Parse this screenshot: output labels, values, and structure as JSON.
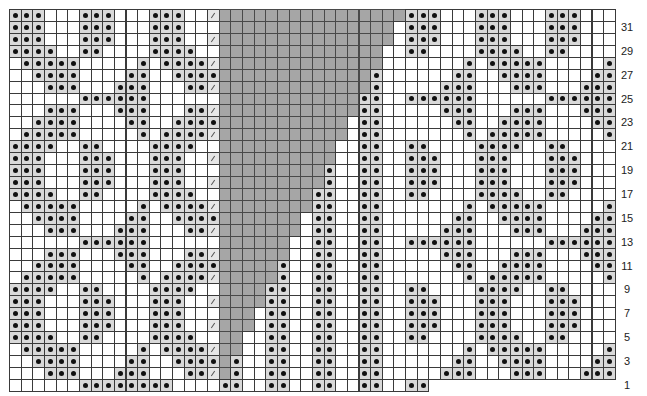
{
  "chart": {
    "title": "",
    "type": "knitting-chart",
    "origin": {
      "x": 9,
      "y": 9
    },
    "cell": {
      "w": 11.65,
      "h": 11.93
    },
    "legend_codes": {
      ".": "empty-cell",
      "o": "dot-stitch",
      "/": "slash-stitch",
      "#": "no-stitch",
      "_": "outside-grid"
    },
    "colors": {
      "dot_bg": "#d9d9d9",
      "no_stitch": "#a6a6a6",
      "grid_line": "#3a3a3a",
      "dot": "#111111"
    },
    "rows": [
      "ooo...ooo...ooo../################ooo...ooo...ooo...",
      "ooo...ooo...ooo...###############.ooo...ooo...ooo...",
      "ooo...ooo...ooo../###############.ooo...ooo...ooo...",
      "oooo..oo....oooo..##############..oo....oooo..oo....",
      ".ooooo.....o.oooo/##############.......o.ooooo.....o",
      "..oooo....oo..oooo#############o......oo..oooo....oo",
      "...ooo...ooo...oo/#############o.....ooo...ooo...ooo",
      "......oooooo......############oo..oooooo......oooooo",
      "...ooo...ooo...oo/############oo.....ooo...ooo...ooo",
      "..oooo....oo..oooo###########.oo......oo..oooo....oo",
      ".ooooo.....o.oooo/###########.oo.......o.ooooo.....o",
      "oooo..oo....oooo..##########..oo..oo....oooo..oo....",
      "ooo...ooo...ooo../##########..oo..ooo...ooo...ooo...",
      "ooo...ooo...ooo...#########o..oo..ooo...ooo...ooo...",
      "ooo...ooo...ooo../#########o..oo..ooo...ooo...ooo...",
      "oooo..oo....oooo..########oo..oo..oo....oooo..oo....",
      ".ooooo.....o.oooo/########oo..oo.......o.ooooo.....o",
      "..oooo....oo..oooo#######.oo..oo......oo..oooo....oo",
      "...ooo...ooo...oo/#######.oo..oo.....ooo...ooo...ooo",
      "......oooooo......######..oo..oo..oooooo......oooooo",
      "...ooo...ooo...oo/######..oo..oo.....ooo...ooo...ooo",
      "..oooo....oo..oooo#####o..oo..oo......oo..oooo....oo",
      ".ooooo.....o.oooo/#####o..oo..oo.......o.ooooo.....o",
      "oooo..oo....oooo..####oo..oo..oo..oo....oooo..oo....",
      "ooo...ooo...ooo../####oo..oo..oo..ooo...ooo...ooo...",
      "ooo...ooo...ooo...###.oo..oo..oo..ooo...ooo...ooo...",
      "ooo...ooo...ooo../###.oo..oo..oo..ooo...ooo...ooo...",
      "oooo..oo....oooo..##..oo..oo..oo..oo....oooo..oo....",
      ".ooooo.....o.oooo/##..oo..oo..oo.......o.ooooo.....o",
      "..oooo....oo..oooo#o..oo..oo..oo......oo..oooo....oo",
      "...ooo...ooo...oo/#o..oo..oo..oo.....ooo...ooo...ooo",
      "......oooooooo....oo..oo..oo..oo..oo________________"
    ],
    "row_labels": [
      {
        "label": "31",
        "row": 1
      },
      {
        "label": "29",
        "row": 3
      },
      {
        "label": "27",
        "row": 5
      },
      {
        "label": "25",
        "row": 7
      },
      {
        "label": "23",
        "row": 9
      },
      {
        "label": "21",
        "row": 11
      },
      {
        "label": "19",
        "row": 13
      },
      {
        "label": "17",
        "row": 15
      },
      {
        "label": "15",
        "row": 17
      },
      {
        "label": "13",
        "row": 19
      },
      {
        "label": "11",
        "row": 21
      },
      {
        "label": "9",
        "row": 23
      },
      {
        "label": "7",
        "row": 25
      },
      {
        "label": "5",
        "row": 27
      },
      {
        "label": "3",
        "row": 29
      },
      {
        "label": "1",
        "row": 31
      }
    ]
  }
}
